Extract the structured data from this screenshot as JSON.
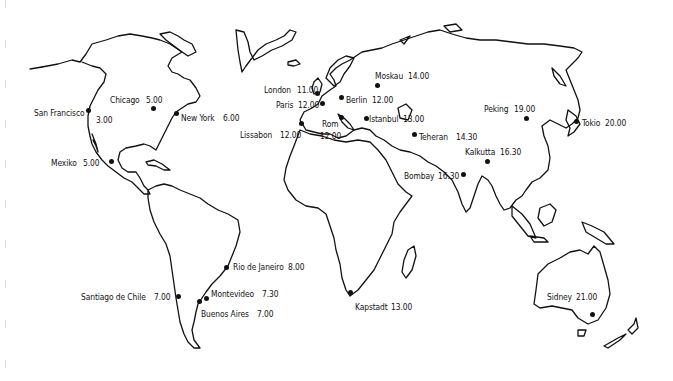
{
  "map": {
    "type": "world-time-zone-map",
    "style": "black outline on white",
    "ink_color": "#111111",
    "background_color": "#ffffff",
    "cities": [
      {
        "name": "San Francisco",
        "time": "3.00",
        "dot": [
          88,
          110
        ],
        "label_name": [
          34,
          107
        ],
        "label_time": [
          96,
          114
        ]
      },
      {
        "name": "Chicago",
        "time": "5.00",
        "dot": [
          153,
          108
        ],
        "label_name": [
          110,
          94
        ],
        "label_time": [
          146,
          94
        ]
      },
      {
        "name": "New York",
        "time": "6.00",
        "dot": [
          176,
          113
        ],
        "label_name": [
          181,
          112
        ],
        "label_time": [
          223,
          112
        ]
      },
      {
        "name": "Mexiko",
        "time": "5.00",
        "dot": [
          111,
          161
        ],
        "label_name": [
          51,
          157
        ],
        "label_time": [
          83,
          157
        ]
      },
      {
        "name": "London",
        "time": "11.00",
        "dot": [
          317,
          93
        ],
        "label_name": [
          264,
          84
        ],
        "label_time": [
          297,
          84
        ]
      },
      {
        "name": "Paris",
        "time": "12.00",
        "dot": [
          322,
          103
        ],
        "label_name": [
          276,
          99
        ],
        "label_time": [
          298,
          99
        ]
      },
      {
        "name": "Berlin",
        "time": "12.00",
        "dot": [
          341,
          97
        ],
        "label_name": [
          346,
          94
        ],
        "label_time": [
          372,
          94
        ]
      },
      {
        "name": "Moskau",
        "time": "14.00",
        "dot": [
          377,
          85
        ],
        "label_name": [
          375,
          70
        ],
        "label_time": [
          408,
          70
        ]
      },
      {
        "name": "Lissabon",
        "time": "12.00",
        "dot": [
          301,
          123
        ],
        "label_name": [
          240,
          129
        ],
        "label_time": [
          280,
          129
        ]
      },
      {
        "name": "Rom",
        "time": "12.00",
        "dot": [
          341,
          117
        ],
        "label_name": [
          322,
          118
        ],
        "label_time": [
          320,
          130
        ]
      },
      {
        "name": "Istanbul",
        "time": "13.00",
        "dot": [
          366,
          118
        ],
        "label_name": [
          369,
          113
        ],
        "label_time": [
          403,
          113
        ]
      },
      {
        "name": "Teheran",
        "time": "14.30",
        "dot": [
          414,
          134
        ],
        "label_name": [
          419,
          131
        ],
        "label_time": [
          456,
          131
        ]
      },
      {
        "name": "Peking",
        "time": "19.00",
        "dot": [
          526,
          118
        ],
        "label_name": [
          484,
          103
        ],
        "label_time": [
          514,
          103
        ]
      },
      {
        "name": "Tokio",
        "time": "20.00",
        "dot": [
          576,
          121
        ],
        "label_name": [
          582,
          117
        ],
        "label_time": [
          605,
          117
        ]
      },
      {
        "name": "Kalkutta",
        "time": "16.30",
        "dot": [
          487,
          161
        ],
        "label_name": [
          465,
          146
        ],
        "label_time": [
          500,
          146
        ]
      },
      {
        "name": "Bombay",
        "time": "16.30",
        "dot": [
          463,
          174
        ],
        "label_name": [
          404,
          170
        ],
        "label_time": [
          438,
          170
        ]
      },
      {
        "name": "Rio de Janeiro",
        "time": "8.00",
        "dot": [
          226,
          267
        ],
        "label_name": [
          233,
          261
        ],
        "label_time": [
          288,
          261
        ]
      },
      {
        "name": "Montevideo",
        "time": "7.30",
        "dot": [
          206,
          298
        ],
        "label_name": [
          211,
          288
        ],
        "label_time": [
          262,
          288
        ]
      },
      {
        "name": "Buenos Aires",
        "time": "7.00",
        "dot": [
          199,
          301
        ],
        "label_name": [
          201,
          308
        ],
        "label_time": [
          257,
          308
        ]
      },
      {
        "name": "Santiago de Chile",
        "time": "7.00",
        "dot": [
          178,
          296
        ],
        "label_name": [
          81,
          291
        ],
        "label_time": [
          154,
          291
        ]
      },
      {
        "name": "Kapstadt",
        "time": "13.00",
        "dot": [
          350,
          292
        ],
        "label_name": [
          355,
          301
        ],
        "label_time": [
          391,
          301
        ]
      },
      {
        "name": "Sidney",
        "time": "21.00",
        "dot": [
          592,
          314
        ],
        "label_name": [
          547,
          291
        ],
        "label_time": [
          576,
          291
        ]
      }
    ]
  }
}
